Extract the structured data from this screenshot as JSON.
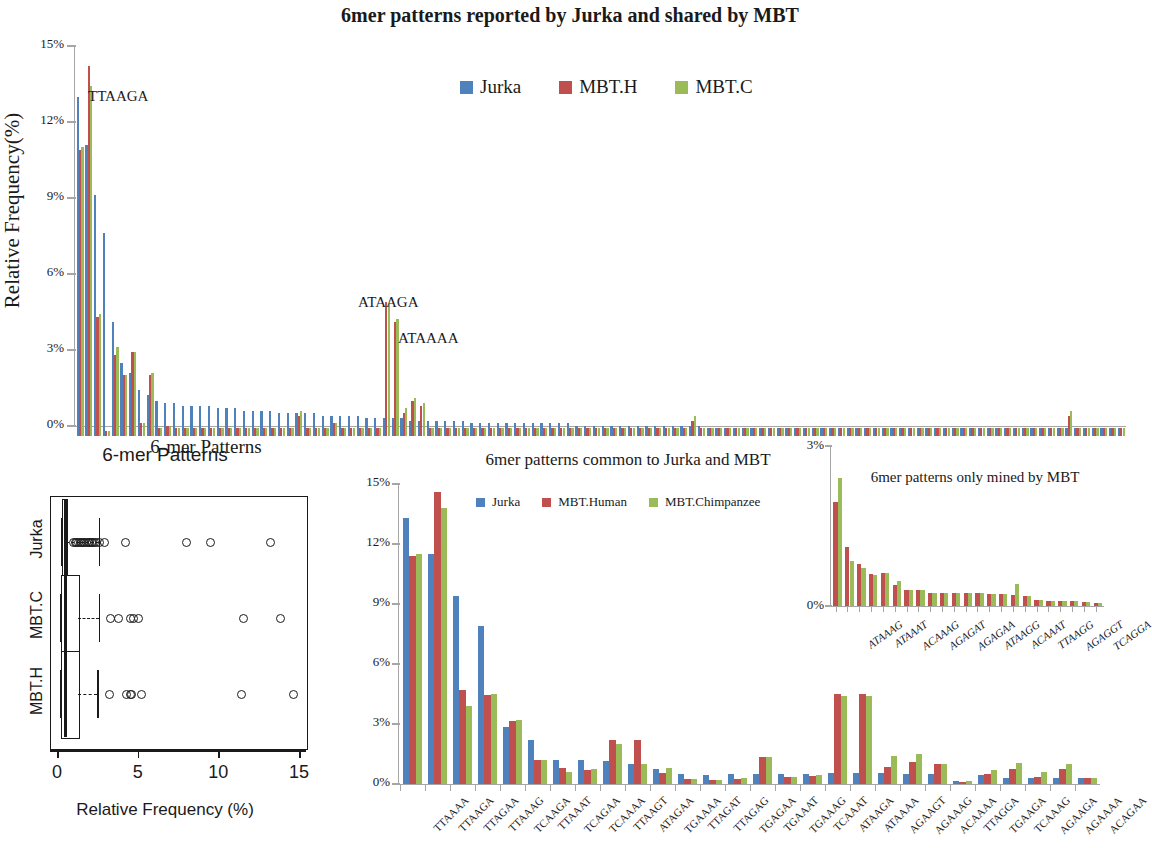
{
  "title": "6mer patterns reported by Jurka and shared by MBT",
  "colors": {
    "jurka": "#4F81BD",
    "mbt_h": "#C0504D",
    "mbt_c": "#9BBB59",
    "axis": "#a6a6a6"
  },
  "top": {
    "ylabel": "Relative Frequency(%)",
    "xlabel": "6-mer Patterns",
    "legend": [
      {
        "label": "Jurka",
        "color": "#4F81BD"
      },
      {
        "label": "MBT.H",
        "color": "#C0504D"
      },
      {
        "label": "MBT.C",
        "color": "#9BBB59"
      }
    ],
    "annotations": [
      {
        "text": "TTAAGA",
        "x": 88,
        "y": 50
      },
      {
        "text": "ATAAGA",
        "x": 358,
        "y": 256
      },
      {
        "text": "ATAAAA",
        "x": 398,
        "y": 292
      }
    ],
    "chart_data": {
      "type": "bar",
      "title": "6mer patterns reported by Jurka and shared by MBT",
      "xlabel": "6-mer Patterns",
      "ylabel": "Relative Frequency(%)",
      "ylim": [
        0,
        15
      ],
      "yticks": [
        "0%",
        "3%",
        "6%",
        "9%",
        "12%",
        "15%"
      ],
      "series": [
        {
          "name": "Jurka",
          "color": "#4F81BD",
          "values": [
            13.4,
            11.5,
            9.5,
            8.0,
            4.5,
            2.9,
            2.5,
            1.8,
            1.6,
            1.4,
            1.3,
            1.3,
            1.2,
            1.2,
            1.2,
            1.2,
            1.1,
            1.1,
            1.1,
            1.0,
            1.0,
            1.0,
            1.0,
            0.9,
            0.9,
            0.9,
            0.9,
            0.9,
            0.8,
            0.8,
            0.8,
            0.8,
            0.8,
            0.7,
            0.7,
            0.7,
            0.7,
            0.7,
            0.6,
            0.6,
            0.6,
            0.6,
            0.6,
            0.6,
            0.6,
            0.5,
            0.5,
            0.5,
            0.5,
            0.5,
            0.5,
            0.5,
            0.5,
            0.5,
            0.5,
            0.5,
            0.5,
            0.4,
            0.4,
            0.4,
            0.4,
            0.4,
            0.4,
            0.4,
            0.4,
            0.4,
            0.4,
            0.4,
            0.4,
            0.4,
            0.4,
            0.4,
            0.3,
            0.3,
            0.3,
            0.3,
            0.3,
            0.3,
            0.3,
            0.3,
            0.3,
            0.3,
            0.3,
            0.3,
            0.3,
            0.3,
            0.3,
            0.3,
            0.3,
            0.3,
            0.3,
            0.3,
            0.3,
            0.3,
            0.3,
            0.3,
            0.3,
            0.3,
            0.3,
            0.3,
            0.3,
            0.3,
            0.3,
            0.3,
            0.3,
            0.3,
            0.3,
            0.3,
            0.3,
            0.3,
            0.3,
            0.3,
            0.3,
            0.3,
            0.3,
            0.3,
            0.3,
            0.3,
            0.3,
            0.3
          ]
        },
        {
          "name": "MBT.H",
          "color": "#C0504D",
          "values": [
            11.3,
            14.6,
            4.7,
            0.2,
            3.2,
            2.4,
            3.3,
            0.5,
            2.4,
            0.3,
            0.4,
            0.3,
            0.3,
            0.3,
            0.3,
            0.3,
            0.3,
            0.3,
            0.3,
            0.3,
            0.3,
            0.3,
            0.3,
            0.3,
            0.3,
            0.8,
            0.3,
            0.3,
            0.3,
            0.5,
            0.3,
            0.3,
            0.3,
            0.3,
            0.3,
            5.3,
            4.5,
            0.9,
            1.4,
            1.2,
            0.3,
            0.3,
            0.3,
            0.3,
            0.3,
            0.3,
            0.3,
            0.3,
            0.3,
            0.3,
            0.3,
            0.3,
            0.3,
            0.3,
            0.3,
            0.3,
            0.3,
            0.3,
            0.3,
            0.3,
            0.3,
            0.3,
            0.3,
            0.3,
            0.3,
            0.3,
            0.3,
            0.3,
            0.3,
            0.3,
            0.6,
            0.3,
            0.3,
            0.3,
            0.3,
            0.3,
            0.3,
            0.3,
            0.3,
            0.3,
            0.3,
            0.3,
            0.3,
            0.3,
            0.3,
            0.3,
            0.3,
            0.3,
            0.3,
            0.3,
            0.3,
            0.3,
            0.3,
            0.3,
            0.3,
            0.3,
            0.3,
            0.3,
            0.3,
            0.3,
            0.3,
            0.3,
            0.3,
            0.3,
            0.3,
            0.3,
            0.3,
            0.3,
            0.3,
            0.3,
            0.3,
            0.3,
            0.3,
            0.8,
            0.3,
            0.3,
            0.3,
            0.3,
            0.3,
            0.3
          ]
        },
        {
          "name": "MBT.C",
          "color": "#9BBB59",
          "values": [
            11.4,
            13.8,
            4.8,
            0.2,
            3.5,
            2.4,
            3.3,
            0.5,
            2.5,
            0.3,
            0.4,
            0.3,
            0.3,
            0.3,
            0.3,
            0.3,
            0.3,
            0.3,
            0.3,
            0.3,
            0.3,
            0.3,
            0.3,
            0.3,
            0.3,
            1.0,
            0.3,
            0.3,
            0.3,
            0.5,
            0.3,
            0.3,
            0.3,
            0.3,
            0.3,
            5.2,
            4.6,
            1.1,
            1.5,
            1.3,
            0.3,
            0.3,
            0.3,
            0.3,
            0.3,
            0.3,
            0.3,
            0.3,
            0.3,
            0.3,
            0.3,
            0.3,
            0.3,
            0.3,
            0.3,
            0.3,
            0.3,
            0.3,
            0.3,
            0.3,
            0.3,
            0.3,
            0.3,
            0.3,
            0.3,
            0.3,
            0.3,
            0.3,
            0.3,
            0.3,
            0.8,
            0.3,
            0.3,
            0.3,
            0.3,
            0.3,
            0.3,
            0.3,
            0.3,
            0.3,
            0.3,
            0.3,
            0.3,
            0.3,
            0.3,
            0.3,
            0.3,
            0.3,
            0.3,
            0.3,
            0.3,
            0.3,
            0.3,
            0.3,
            0.3,
            0.3,
            0.3,
            0.3,
            0.3,
            0.3,
            0.3,
            0.3,
            0.3,
            0.3,
            0.3,
            0.3,
            0.3,
            0.3,
            0.3,
            0.3,
            0.3,
            0.3,
            0.3,
            1.0,
            0.3,
            0.3,
            0.3,
            0.3,
            0.3,
            0.3
          ]
        }
      ]
    }
  },
  "boxplot": {
    "title": "6-mer Patterns",
    "xlabel": "Relative Frequency (%)",
    "xticks": [
      "0",
      "5",
      "10",
      "15"
    ],
    "xlim": [
      0,
      15
    ],
    "groups": [
      "Jurka",
      "MBT.C",
      "MBT.H"
    ],
    "chart_data": {
      "type": "boxplot",
      "title": "6-mer Patterns",
      "xlabel": "Relative Frequency (%)",
      "xlim": [
        0,
        15
      ],
      "xticks": [
        0,
        5,
        10,
        15
      ],
      "boxes": [
        {
          "name": "Jurka",
          "min": 0.25,
          "q1": 0.3,
          "median": 0.42,
          "q3": 0.55,
          "max": 2.6,
          "outliers": [
            1.0,
            1.1,
            1.2,
            1.3,
            1.4,
            1.5,
            1.6,
            1.7,
            1.8,
            1.9,
            2.0,
            2.1,
            2.2,
            2.3,
            2.4,
            2.6,
            2.9,
            4.2,
            8.0,
            9.5,
            13.2
          ]
        },
        {
          "name": "MBT.C",
          "median": 0.45,
          "q1": 0.25,
          "q3": 1.3,
          "min": 0.2,
          "max": 2.6,
          "outliers": [
            3.3,
            3.8,
            4.5,
            4.7,
            5.0,
            11.5,
            13.8
          ]
        },
        {
          "name": "MBT.H",
          "median": 0.45,
          "q1": 0.25,
          "q3": 1.3,
          "min": 0.2,
          "max": 2.5,
          "outliers": [
            3.2,
            4.3,
            4.5,
            4.6,
            5.2,
            11.4,
            14.6
          ]
        }
      ]
    }
  },
  "mid": {
    "title": "6mer patterns common to Jurka and MBT",
    "legend": [
      {
        "label": "Jurka",
        "color": "#4F81BD"
      },
      {
        "label": "MBT.Human",
        "color": "#C0504D"
      },
      {
        "label": "MBT.Chimpanzee",
        "color": "#9BBB59"
      }
    ],
    "chart_data": {
      "type": "bar",
      "title": "6mer patterns common to Jurka and MBT",
      "ylim": [
        0,
        15
      ],
      "yticks": [
        "0%",
        "3%",
        "6%",
        "9%",
        "12%",
        "15%"
      ],
      "categories": [
        "TTAAAA",
        "TTAAGA",
        "TTAGAA",
        "TTAAAG",
        "TCAAGA",
        "TTAAAT",
        "TCAGAA",
        "TCAAAA",
        "TTAAGT",
        "ATAGAA",
        "TGAAAA",
        "TTAGAT",
        "TTAGAG",
        "TGAGAA",
        "TGAAAT",
        "TGAAAG",
        "TCAAAT",
        "ATAAGA",
        "ATAAAA",
        "AGAAGT",
        "AGAAAG",
        "ACAAAA",
        "TTAGGA",
        "TGAAGA",
        "TCAAAG",
        "AGAAGA",
        "AGAAAA",
        "ACAGAA"
      ],
      "series": [
        {
          "name": "Jurka",
          "color": "#4F81BD",
          "values": [
            13.3,
            11.5,
            9.4,
            7.9,
            2.85,
            2.2,
            1.2,
            1.2,
            1.15,
            1.0,
            0.75,
            0.5,
            0.45,
            0.5,
            0.5,
            0.5,
            0.5,
            0.55,
            0.55,
            0.55,
            0.5,
            0.5,
            0.15,
            0.45,
            0.3,
            0.3,
            0.3,
            0.3
          ]
        },
        {
          "name": "MBT.Human",
          "color": "#C0504D",
          "values": [
            11.4,
            14.6,
            4.7,
            4.45,
            3.15,
            1.2,
            0.8,
            0.7,
            2.2,
            2.2,
            0.55,
            0.25,
            0.2,
            0.25,
            1.35,
            0.35,
            0.4,
            4.5,
            4.5,
            0.85,
            1.1,
            1.0,
            0.1,
            0.5,
            0.75,
            0.35,
            0.75,
            0.3
          ]
        },
        {
          "name": "MBT.Chimpanzee",
          "color": "#9BBB59",
          "values": [
            11.5,
            13.8,
            3.9,
            4.5,
            3.2,
            1.2,
            0.6,
            0.75,
            2.0,
            1.0,
            0.8,
            0.25,
            0.2,
            0.3,
            1.35,
            0.35,
            0.45,
            4.4,
            4.4,
            1.4,
            1.5,
            1.0,
            0.15,
            0.7,
            1.05,
            0.6,
            1.0,
            0.3
          ]
        }
      ]
    }
  },
  "inset": {
    "title": "6mer patterns only mined by MBT",
    "chart_data": {
      "type": "bar",
      "title": "6mer patterns only mined by MBT",
      "ylim": [
        0,
        3
      ],
      "yticks": [
        "0%",
        "3%"
      ],
      "categories": [
        "ATAAAG",
        "ATAAAT",
        "ACAAAG",
        "AGAGAT",
        "AGAGAA",
        "ATAAGG",
        "ACAAAT",
        "TTAAGG",
        "AGAGGT",
        "TCAGGA"
      ],
      "series": [
        {
          "name": "MBT.Human",
          "color": "#C0504D",
          "values": [
            1.95,
            1.1,
            0.78,
            0.6,
            0.62,
            0.4,
            0.3,
            0.3,
            0.25,
            0.25,
            0.24,
            0.25,
            0.25,
            0.22,
            0.22,
            0.2,
            0.18,
            0.12,
            0.1,
            0.1,
            0.1,
            0.08,
            0.06
          ]
        },
        {
          "name": "MBT.Chimpanzee",
          "color": "#9BBB59",
          "values": [
            2.4,
            0.85,
            0.72,
            0.58,
            0.62,
            0.46,
            0.3,
            0.3,
            0.25,
            0.25,
            0.24,
            0.25,
            0.25,
            0.22,
            0.22,
            0.42,
            0.18,
            0.12,
            0.1,
            0.1,
            0.1,
            0.08,
            0.06
          ]
        }
      ]
    }
  }
}
